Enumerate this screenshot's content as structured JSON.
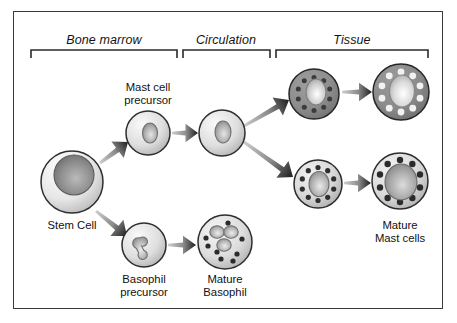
{
  "figure": {
    "background_color": "#ffffff",
    "border_color": "#3a3a3a"
  },
  "sections": [
    {
      "id": "bone-marrow",
      "label": "Bone marrow",
      "bracket": {
        "x1": 31,
        "x2": 177,
        "y": 50,
        "tick": 8
      },
      "label_x": 104,
      "label_y": 33
    },
    {
      "id": "circulation",
      "label": "Circulation",
      "bracket": {
        "x1": 183,
        "x2": 270,
        "y": 50,
        "tick": 8
      },
      "label_x": 226,
      "label_y": 33
    },
    {
      "id": "tissue",
      "label": "Tissue",
      "bracket": {
        "x1": 276,
        "x2": 428,
        "y": 50,
        "tick": 8
      },
      "label_x": 352,
      "label_y": 33
    }
  ],
  "cells": [
    {
      "id": "stem-cell",
      "name": "Stem Cell",
      "cx": 72,
      "cy": 182,
      "r": 31,
      "body_fill": "#e6e6e6",
      "body_stroke": "#2e2e2e",
      "nucleus": {
        "type": "round",
        "cx": 74,
        "cy": 175,
        "rx": 20,
        "ry": 20,
        "fill": "#8f8f8f"
      },
      "granules": [],
      "label": "Stem Cell",
      "label_x": 72,
      "label_y": 219,
      "label_align": "center"
    },
    {
      "id": "mast-cell-precursor",
      "name": "Mast cell precursor",
      "cx": 148,
      "cy": 133,
      "r": 22,
      "body_fill": "#dedede",
      "body_stroke": "#2e2e2e",
      "nucleus": {
        "type": "oval",
        "cx": 150,
        "cy": 133,
        "rx": 7.5,
        "ry": 10,
        "fill": "#b0b0b0"
      },
      "granules": [],
      "label": "Mast cell\nprecursor",
      "label_x": 148,
      "label_y": 81,
      "label_align": "center"
    },
    {
      "id": "circulating-mast-cell",
      "name": "Circulating mast cell",
      "cx": 222,
      "cy": 133,
      "r": 23,
      "body_fill": "#dedede",
      "body_stroke": "#2e2e2e",
      "nucleus": {
        "type": "oval",
        "cx": 223,
        "cy": 132,
        "rx": 8,
        "ry": 11,
        "fill": "#b0b0b0"
      },
      "granules": [],
      "label": "",
      "label_x": 222,
      "label_y": 170,
      "label_align": "center"
    },
    {
      "id": "tissue-mast-cell-dark",
      "name": "Tissue mast cell (dark, dark granules)",
      "cx": 314,
      "cy": 94,
      "r": 25,
      "body_fill": "#8d8d8d",
      "body_stroke": "#262626",
      "nucleus": {
        "type": "oval",
        "cx": 316,
        "cy": 92,
        "rx": 10,
        "ry": 13,
        "fill": "#cfcfcf"
      },
      "granules": {
        "count": 10,
        "radius": 16.5,
        "dot_r": 2.5,
        "fill": "#3b3b3b",
        "start_angle": -90
      },
      "label": "",
      "label_x": 314,
      "label_y": 128,
      "label_align": "center"
    },
    {
      "id": "mature-mast-cell-dark",
      "name": "Mature mast cell (dark, light granules)",
      "cx": 401,
      "cy": 92,
      "r": 28,
      "body_fill": "#8a8a8a",
      "body_stroke": "#262626",
      "nucleus": {
        "type": "oval",
        "cx": 402,
        "cy": 91,
        "rx": 12.5,
        "ry": 16,
        "fill": "#d9d9d9"
      },
      "granules": {
        "count": 10,
        "radius": 20,
        "dot_r": 3.4,
        "fill": "#f2f2f2",
        "start_angle": -90
      },
      "label": "",
      "label_x": 401,
      "label_y": 126,
      "label_align": "center"
    },
    {
      "id": "tissue-mast-cell-light",
      "name": "Tissue mast cell (light, dark granules)",
      "cx": 318,
      "cy": 184,
      "r": 24,
      "body_fill": "#d7d7d7",
      "body_stroke": "#2b2b2b",
      "nucleus": {
        "type": "oval",
        "cx": 319,
        "cy": 184,
        "rx": 10,
        "ry": 12.5,
        "fill": "#b4b4b4"
      },
      "granules": {
        "count": 10,
        "radius": 16.5,
        "dot_r": 2.6,
        "fill": "#2f2f2f",
        "start_angle": -90
      },
      "label": "",
      "label_x": 318,
      "label_y": 217,
      "label_align": "center"
    },
    {
      "id": "mature-mast-cell-light",
      "name": "Mature mast cell (light, dark granules)",
      "cx": 400,
      "cy": 181,
      "r": 28,
      "body_fill": "#d9d9d9",
      "body_stroke": "#2b2b2b",
      "nucleus": {
        "type": "round",
        "cx": 401,
        "cy": 182,
        "rx": 16,
        "ry": 18,
        "fill": "#a9a9a9"
      },
      "granules": {
        "count": 10,
        "radius": 21,
        "dot_r": 3.2,
        "fill": "#2b2b2b",
        "start_angle": -90
      },
      "label": "Mature\nMast cells",
      "label_x": 400,
      "label_y": 219,
      "label_align": "center"
    },
    {
      "id": "basophil-precursor",
      "name": "Basophil precursor",
      "cx": 144,
      "cy": 245,
      "r": 22,
      "body_fill": "#dedede",
      "body_stroke": "#2e2e2e",
      "nucleus": {
        "type": "bilobed",
        "cx": 144,
        "cy": 245,
        "rx": 5,
        "ry": 5,
        "fill": "#b6b6b6"
      },
      "granules": [],
      "label": "Basophil\nprecursor",
      "label_x": 144,
      "label_y": 273,
      "label_align": "center"
    },
    {
      "id": "mature-basophil",
      "name": "Mature Basophil",
      "cx": 225,
      "cy": 242,
      "r": 27,
      "body_fill": "#dcdcdc",
      "body_stroke": "#2e2e2e",
      "nucleus": {
        "type": "trilobed",
        "cx": 224,
        "cy": 237,
        "rx": 9,
        "ry": 9,
        "fill": "#b6b6b6"
      },
      "granules": {
        "count": 9,
        "scatter": true,
        "dot_r": 2.6,
        "fill": "#2b2b2b"
      },
      "label": "Mature\nBasophil",
      "label_x": 225,
      "label_y": 273,
      "label_align": "center"
    }
  ],
  "arrows": [
    {
      "id": "stem-to-mast-precursor",
      "from": "stem-cell",
      "to": "mast-cell-precursor",
      "x1": 100,
      "y1": 163,
      "x2": 128,
      "y2": 142,
      "width": 9
    },
    {
      "id": "stem-to-basophil-precursor",
      "from": "stem-cell",
      "to": "basophil-precursor",
      "x1": 96,
      "y1": 211,
      "x2": 127,
      "y2": 236,
      "width": 9
    },
    {
      "id": "mast-precursor-to-circulation",
      "from": "mast-cell-precursor",
      "to": "circulating-mast-cell",
      "x1": 172,
      "y1": 133,
      "x2": 198,
      "y2": 133,
      "width": 8
    },
    {
      "id": "circulation-to-tissue-upper",
      "from": "circulating-mast-cell",
      "to": "tissue-mast-cell-dark",
      "x1": 244,
      "y1": 126,
      "x2": 289,
      "y2": 100,
      "width": 9
    },
    {
      "id": "circulation-to-tissue-lower",
      "from": "circulating-mast-cell",
      "to": "tissue-mast-cell-light",
      "x1": 244,
      "y1": 142,
      "x2": 293,
      "y2": 177,
      "width": 9
    },
    {
      "id": "tissue-dark-to-mature-dark",
      "from": "tissue-mast-cell-dark",
      "to": "mature-mast-cell-dark",
      "x1": 342,
      "y1": 92,
      "x2": 372,
      "y2": 92,
      "width": 8
    },
    {
      "id": "tissue-light-to-mature-light",
      "from": "tissue-mast-cell-light",
      "to": "mature-mast-cell-light",
      "x1": 344,
      "y1": 183,
      "x2": 371,
      "y2": 183,
      "width": 8
    },
    {
      "id": "basophil-precursor-to-mature",
      "from": "basophil-precursor",
      "to": "mature-basophil",
      "x1": 168,
      "y1": 245,
      "x2": 196,
      "y2": 245,
      "width": 8
    }
  ],
  "arrow_style": {
    "tail_color": "#cdcdcd",
    "head_color": "#1d1d1d"
  }
}
